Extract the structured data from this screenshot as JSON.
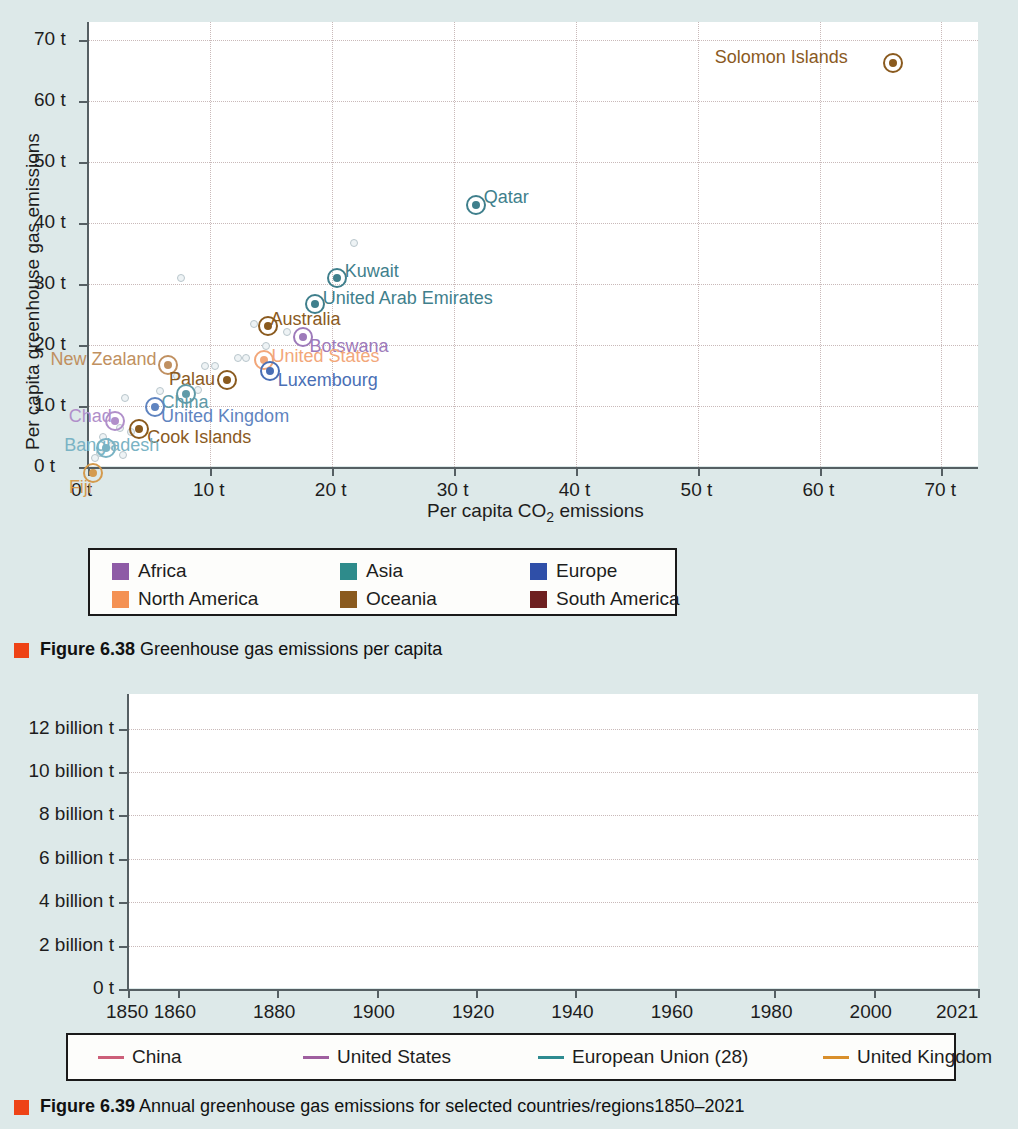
{
  "figure_638": {
    "caption_bold": "Figure 6.38",
    "caption_rest": "Greenhouse gas emissions per capita",
    "legend_title": "",
    "legend": [
      {
        "label": "Africa",
        "color": "#8e5ba6"
      },
      {
        "label": "Asia",
        "color": "#2e8b8b"
      },
      {
        "label": "Europe",
        "color": "#2f4fa8"
      },
      {
        "label": "North America",
        "color": "#f49153"
      },
      {
        "label": "Oceania",
        "color": "#8a5a1e"
      },
      {
        "label": "South America",
        "color": "#6e2020"
      }
    ]
  },
  "figure_639": {
    "caption_bold": "Figure 6.39",
    "caption_rest": "Annual greenhouse gas emissions for selected countries/regions1850–2021"
  },
  "chart_data": [
    {
      "type": "scatter",
      "title": "Greenhouse gas emissions per capita",
      "xlabel": "Per capita CO₂ emissions",
      "ylabel": "Per capita greenhouse gas emissions",
      "xlim": [
        0,
        73
      ],
      "ylim": [
        0,
        73
      ],
      "xticks": [
        "0 t",
        "10 t",
        "20 t",
        "30 t",
        "40 t",
        "50 t",
        "60 t",
        "70 t"
      ],
      "xtickvals": [
        0,
        10,
        20,
        30,
        40,
        50,
        60,
        70
      ],
      "yticks": [
        "0 t",
        "10 t",
        "20 t",
        "30 t",
        "40 t",
        "50 t",
        "60 t",
        "70 t"
      ],
      "ytickvals": [
        0,
        10,
        20,
        30,
        40,
        50,
        60,
        70
      ],
      "grid": true,
      "legend_position": "below",
      "series_key": "continent",
      "points": [
        {
          "label": "Solomon Islands",
          "x": 66.0,
          "y": 66.2,
          "continent": "Oceania",
          "color": "#8a5a1e",
          "lx": -178,
          "ly": -16
        },
        {
          "label": "Qatar",
          "x": 31.8,
          "y": 43.0,
          "continent": "Asia",
          "color": "#3f7f8c",
          "lx": 8,
          "ly": -18
        },
        {
          "label": "Kuwait",
          "x": 20.4,
          "y": 31.0,
          "continent": "Asia",
          "color": "#3f7f8c",
          "lx": 8,
          "ly": -17
        },
        {
          "label": "United Arab Emirates",
          "x": 18.6,
          "y": 26.8,
          "continent": "Asia",
          "color": "#3f7f8c",
          "lx": 8,
          "ly": -16
        },
        {
          "label": "Australia",
          "x": 14.8,
          "y": 23.2,
          "continent": "Oceania",
          "color": "#8a5a1e",
          "lx": 2,
          "ly": -17
        },
        {
          "label": "Botswana",
          "x": 17.6,
          "y": 21.4,
          "continent": "Africa",
          "color": "#9d7aba",
          "lx": 7,
          "ly": -1
        },
        {
          "label": "United States",
          "x": 14.4,
          "y": 17.6,
          "continent": "North America",
          "color": "#f2a77a",
          "lx": 8,
          "ly": -14
        },
        {
          "label": "Luxembourg",
          "x": 14.9,
          "y": 15.7,
          "continent": "Europe",
          "color": "#4a6fb5",
          "lx": 8,
          "ly": -1
        },
        {
          "label": "New Zealand",
          "x": 6.6,
          "y": 16.8,
          "continent": "Oceania",
          "color": "#c09060",
          "lx": -118,
          "ly": -16
        },
        {
          "label": "Palau",
          "x": 11.4,
          "y": 14.2,
          "continent": "Oceania",
          "color": "#8a5a1e",
          "lx": -58,
          "ly": -11
        },
        {
          "label": "China",
          "x": 8.0,
          "y": 12.0,
          "continent": "Asia",
          "color": "#5f9aa8",
          "lx": -24,
          "ly": -2
        },
        {
          "label": "United Kingdom",
          "x": 5.5,
          "y": 9.9,
          "continent": "Europe",
          "color": "#5f84c0",
          "lx": 6,
          "ly": -1
        },
        {
          "label": "Chad",
          "x": 2.2,
          "y": 7.6,
          "continent": "Africa",
          "color": "#b08fca",
          "lx": -46,
          "ly": -15
        },
        {
          "label": "Cook Islands",
          "x": 4.2,
          "y": 6.3,
          "continent": "Oceania",
          "color": "#8a5a1e",
          "lx": 8,
          "ly": -2
        },
        {
          "label": "Bangladesh",
          "x": 1.5,
          "y": 3.1,
          "continent": "Asia",
          "color": "#7ab3c4",
          "lx": -42,
          "ly": -13
        },
        {
          "label": "Fiji",
          "x": 0.4,
          "y": -1.0,
          "continent": "Oceania",
          "color": "#d49a4d",
          "lx": -24,
          "ly": 4
        }
      ],
      "background_points": [
        {
          "x": 21.8,
          "y": 36.7
        },
        {
          "x": 7.6,
          "y": 31.0
        },
        {
          "x": 13.6,
          "y": 23.4
        },
        {
          "x": 16.3,
          "y": 22.1
        },
        {
          "x": 14.6,
          "y": 19.9
        },
        {
          "x": 12.3,
          "y": 17.9
        },
        {
          "x": 13.0,
          "y": 17.8
        },
        {
          "x": 9.6,
          "y": 16.6
        },
        {
          "x": 10.4,
          "y": 16.5
        },
        {
          "x": 7.3,
          "y": 15.0
        },
        {
          "x": 3.0,
          "y": 11.3
        },
        {
          "x": 9.0,
          "y": 12.6
        },
        {
          "x": 5.9,
          "y": 12.5
        },
        {
          "x": 1.2,
          "y": 5.0
        },
        {
          "x": 2.6,
          "y": 6.4
        },
        {
          "x": 3.5,
          "y": 5.8
        },
        {
          "x": 2.0,
          "y": 3.6
        },
        {
          "x": 1.0,
          "y": 2.3
        },
        {
          "x": 2.9,
          "y": 2.0
        },
        {
          "x": 0.6,
          "y": 1.4
        }
      ]
    },
    {
      "type": "line",
      "title": "Annual greenhouse gas emissions for selected countries/regions 1850–2021",
      "xlabel": "",
      "ylabel": "",
      "xlim": [
        1850,
        2021
      ],
      "ylim": [
        0,
        13.6
      ],
      "xticks": [
        "1850",
        "1860",
        "1880",
        "1900",
        "1920",
        "1940",
        "1960",
        "1980",
        "2000",
        "2021"
      ],
      "xtickvals": [
        1850,
        1860,
        1880,
        1900,
        1920,
        1940,
        1960,
        1980,
        2000,
        2021
      ],
      "yticks": [
        "0 t",
        "2 billion t",
        "4 billion t",
        "6 billion t",
        "8 billion t",
        "10 billion t",
        "12 billion t"
      ],
      "ytickvals": [
        0,
        2,
        4,
        6,
        8,
        10,
        12
      ],
      "grid": true,
      "legend_position": "below",
      "series": [
        {
          "name": "China",
          "color": "#cc5f79",
          "x": [
            1850,
            1870,
            1890,
            1900,
            1910,
            1920,
            1930,
            1940,
            1945,
            1950,
            1955,
            1958,
            1960,
            1962,
            1965,
            1970,
            1975,
            1980,
            1985,
            1990,
            1995,
            2000,
            2002,
            2004,
            2006,
            2008,
            2010,
            2012,
            2014,
            2016,
            2018,
            2020,
            2021
          ],
          "values": [
            0.35,
            0.36,
            0.38,
            0.4,
            0.43,
            0.47,
            0.5,
            0.55,
            0.52,
            0.55,
            0.7,
            1.0,
            0.85,
            0.75,
            0.95,
            1.3,
            1.75,
            2.1,
            2.7,
            3.3,
            4.2,
            4.5,
            4.9,
            6.0,
            7.3,
            8.4,
            9.6,
            10.9,
            11.4,
            11.2,
            12.2,
            12.8,
            13.4
          ]
        },
        {
          "name": "United States",
          "color": "#9f5f9f",
          "x": [
            1850,
            1860,
            1870,
            1880,
            1890,
            1900,
            1910,
            1920,
            1925,
            1930,
            1935,
            1940,
            1945,
            1950,
            1955,
            1960,
            1965,
            1970,
            1975,
            1980,
            1985,
            1990,
            1995,
            2000,
            2004,
            2007,
            2010,
            2013,
            2016,
            2019,
            2020,
            2021
          ],
          "values": [
            0.85,
            0.95,
            1.05,
            1.4,
            1.75,
            2.2,
            2.8,
            3.2,
            3.4,
            3.7,
            3.2,
            3.6,
            3.9,
            4.3,
            4.6,
            4.7,
            5.1,
            5.75,
            5.6,
            6.0,
            5.75,
            6.2,
            6.45,
            6.85,
            6.95,
            6.9,
            6.55,
            6.4,
            6.1,
            6.0,
            5.55,
            5.8
          ]
        },
        {
          "name": "European Union (28)",
          "color": "#2e8b90",
          "x": [
            1850,
            1860,
            1870,
            1880,
            1890,
            1900,
            1910,
            1915,
            1920,
            1925,
            1930,
            1935,
            1940,
            1943,
            1945,
            1950,
            1955,
            1960,
            1965,
            1970,
            1975,
            1978,
            1980,
            1985,
            1990,
            1995,
            2000,
            2005,
            2010,
            2014,
            2018,
            2020,
            2021
          ],
          "values": [
            0.55,
            0.7,
            0.9,
            1.15,
            1.5,
            1.9,
            2.25,
            2.1,
            2.1,
            2.35,
            2.3,
            2.45,
            2.55,
            2.6,
            1.55,
            2.4,
            3.0,
            3.4,
            3.9,
            4.7,
            5.2,
            5.55,
            5.6,
            5.35,
            5.45,
            5.25,
            5.2,
            5.25,
            4.7,
            4.3,
            4.2,
            3.6,
            3.8
          ]
        },
        {
          "name": "United Kingdom",
          "color": "#d98f2b",
          "x": [
            1850,
            1860,
            1870,
            1880,
            1890,
            1900,
            1910,
            1920,
            1921,
            1924,
            1926,
            1930,
            1935,
            1940,
            1945,
            1950,
            1955,
            1960,
            1965,
            1970,
            1975,
            1980,
            1985,
            1990,
            1995,
            2000,
            2005,
            2010,
            2014,
            2018,
            2020,
            2021
          ],
          "values": [
            0.17,
            0.22,
            0.3,
            0.38,
            0.46,
            0.55,
            0.62,
            0.63,
            0.47,
            0.64,
            0.45,
            0.63,
            0.62,
            0.7,
            0.68,
            0.78,
            0.82,
            0.82,
            0.82,
            0.82,
            0.78,
            0.76,
            0.73,
            0.74,
            0.7,
            0.69,
            0.67,
            0.6,
            0.52,
            0.45,
            0.39,
            0.42
          ]
        }
      ]
    }
  ]
}
